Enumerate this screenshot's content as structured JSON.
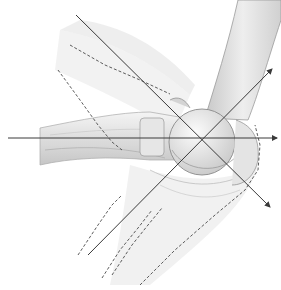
{
  "figure": {
    "colors": {
      "background": "#ffffff",
      "bone_light": "#f2f2f2",
      "bone_mid": "#d9d9d9",
      "bone_shadow": "#b5b5b5",
      "outline": "#8a8a8a",
      "axis_line": "#3a3a3a",
      "dashed_line": "#4a4a4a"
    },
    "center": {
      "x": 203,
      "y": 139
    },
    "axes": [
      {
        "name": "horizontal-axis",
        "x1": 8,
        "y1": 138,
        "x2": 277,
        "y2": 138,
        "arrow": true
      },
      {
        "name": "upper-right-axis",
        "x1": 88,
        "y1": 255,
        "x2": 272,
        "y2": 69,
        "arrow": true
      },
      {
        "name": "lower-right-axis",
        "x1": 76,
        "y1": 15,
        "x2": 270,
        "y2": 207,
        "arrow": true
      }
    ],
    "dashed_outlines": [
      {
        "name": "upper-dashed-contour-1",
        "points": "70,45 105,65 140,80 170,94"
      },
      {
        "name": "upper-dashed-contour-2",
        "points": "58,70 80,100 98,125 112,142 122,150"
      },
      {
        "name": "lower-dashed-contour-1",
        "points": "78,255 98,225 112,205 122,195"
      },
      {
        "name": "lower-dashed-contour-2",
        "points": "102,278 120,250 138,228 152,210"
      },
      {
        "name": "lower-dashed-contour-3",
        "points": "112,275 132,245 148,225 162,208"
      },
      {
        "name": "right-dashed-contour",
        "points": "140,285 175,250 215,215 245,190 258,170 260,145 255,125"
      }
    ]
  }
}
